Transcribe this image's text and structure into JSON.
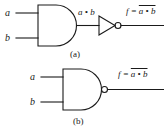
{
  "figure": {
    "background_color": "#ffffff",
    "line_color": "#1a1a1a",
    "text_color": "#1a1a1a"
  },
  "part_a": {
    "caption": "(a)",
    "gate_type": "AND gate feeding an inverter",
    "inputs": [
      {
        "label": "a"
      },
      {
        "label": "b"
      }
    ],
    "intermediate_wire_label": "a • b",
    "output": {
      "prefix": "f =",
      "expression": "a • b",
      "overbar": true
    },
    "gates": [
      {
        "name": "and-gate",
        "symbol": "AND"
      },
      {
        "name": "not-gate",
        "symbol": "NOT"
      }
    ]
  },
  "part_b": {
    "caption": "(b)",
    "gate_type": "NAND gate",
    "inputs": [
      {
        "label": "a"
      },
      {
        "label": "b"
      }
    ],
    "output": {
      "prefix": "f =",
      "expression": "a • b",
      "overbar": true
    },
    "gates": [
      {
        "name": "nand-gate",
        "symbol": "NAND"
      }
    ]
  }
}
